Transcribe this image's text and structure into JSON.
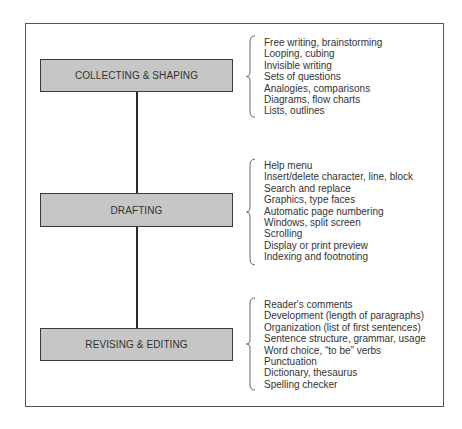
{
  "diagram": {
    "type": "process-flow",
    "stages": [
      {
        "label": "COLLECTING & SHAPING",
        "items": [
          "Free writing, brainstorming",
          "Looping, cubing",
          "Invisible writing",
          "Sets of questions",
          "Analogies, comparisons",
          "Diagrams, flow charts",
          "Lists, outlines"
        ]
      },
      {
        "label": "DRAFTING",
        "items": [
          "Help menu",
          "Insert/delete character, line, block",
          "Search and replace",
          "Graphics, type faces",
          "Automatic page numbering",
          "Windows, split screen",
          "Scrolling",
          "Display or print preview",
          "Indexing and footnoting"
        ]
      },
      {
        "label": "REVISING & EDITING",
        "items": [
          "Reader's comments",
          "Development (length of paragraphs)",
          "Organization (list of first sentences)",
          "Sentence structure, grammar, usage",
          "Word choice, “to be” verbs",
          "Punctuation",
          "Dictionary, thesaurus",
          "Spelling checker"
        ]
      }
    ],
    "colors": {
      "box_fill": "#c6c6c6",
      "box_border": "#3a3a3a",
      "text": "#333333",
      "frame": "#555555"
    }
  }
}
